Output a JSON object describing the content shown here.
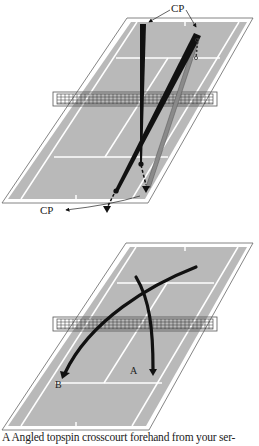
{
  "figure": {
    "top_diagram": {
      "labels": {
        "cp_top": "CP",
        "cp_bottom": "CP"
      },
      "description": "Two shot paths with contact points (CP) marked"
    },
    "bottom_diagram": {
      "labels": {
        "a": "A",
        "b": "B"
      },
      "description": "Two curved shot paths A and B crossing over net"
    },
    "caption": "A Angled topspin crosscourt forehand from your ser-",
    "colors": {
      "court": "#b9b9b9",
      "lines": "#ffffff",
      "outline": "#555555",
      "path": "#111111",
      "path_gray": "#8a8a8a",
      "background": "#ffffff"
    }
  }
}
